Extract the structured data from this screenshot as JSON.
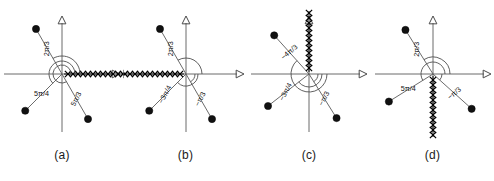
{
  "figure": {
    "panel_count": 4,
    "colors": {
      "axis": "#6b6b6b",
      "ray": "#5a5a5a",
      "pole": "#111111",
      "zero": "#000000",
      "arc": "#4f4f4f",
      "background": "#ffffff",
      "text": "#1a1a1a"
    },
    "marker_semantics": {
      "filled_dot": "pole",
      "x_mark": "zero"
    }
  },
  "panels": [
    {
      "id": "a",
      "caption": "(a)",
      "poles": [
        {
          "angle_label": "2π/3",
          "angle_deg": 120,
          "radius": 52,
          "label_rotation_deg": -90
        },
        {
          "angle_label": "5π/4",
          "angle_deg": 225,
          "radius": 52,
          "label_rotation_deg": 0
        },
        {
          "angle_label": "5π/3",
          "angle_deg": 300,
          "radius": 52,
          "label_rotation_deg": -62
        }
      ],
      "zero_chain": {
        "direction": "positive-real-axis",
        "direction_deg": 0,
        "count": 12,
        "has_arrowhead": true
      },
      "arcs": [
        {
          "for_angle_label": "2π/3",
          "radius": 18
        },
        {
          "for_angle_label": "5π/4",
          "radius": 13
        },
        {
          "for_angle_label": "5π/3",
          "radius": 9
        }
      ],
      "axes": {
        "real": "horizontal",
        "imaginary": "vertical"
      }
    },
    {
      "id": "b",
      "caption": "(b)",
      "poles": [
        {
          "angle_label": "2π/3",
          "angle_deg": 120,
          "radius": 52,
          "label_rotation_deg": -90
        },
        {
          "angle_label": "−3π/4",
          "angle_deg": 225,
          "radius": 52,
          "label_rotation_deg": -62
        },
        {
          "angle_label": "−π/3",
          "angle_deg": 300,
          "radius": 52,
          "label_rotation_deg": -62
        }
      ],
      "zero_chain": {
        "direction": "negative-real-axis",
        "direction_deg": 180,
        "count": 12,
        "has_arrowhead": false
      },
      "arcs": [
        {
          "for_angle_label": "2π/3",
          "radius": 16
        },
        {
          "for_angle_label": "−3π/4",
          "radius": 12
        },
        {
          "for_angle_label": "−π/3",
          "radius": 9
        }
      ],
      "axes": {
        "real": "horizontal",
        "imaginary": "vertical"
      }
    },
    {
      "id": "c",
      "caption": "(c)",
      "poles": [
        {
          "angle_label": "−4π/3",
          "angle_deg": 132,
          "radius": 52,
          "label_rotation_deg": -40
        },
        {
          "angle_label": "−3π/4",
          "angle_deg": 218,
          "radius": 52,
          "label_rotation_deg": -62
        },
        {
          "angle_label": "−π/3",
          "angle_deg": 302,
          "radius": 52,
          "label_rotation_deg": -62
        }
      ],
      "zero_chain": {
        "direction": "positive-imaginary-axis",
        "direction_deg": 90,
        "count": 12,
        "has_arrowhead": false
      },
      "arcs": [
        {
          "for_angle_label": "−4π/3",
          "radius": 18
        },
        {
          "for_angle_label": "−3π/4",
          "radius": 13
        },
        {
          "for_angle_label": "−π/3",
          "radius": 9
        }
      ],
      "axes": {
        "real": "horizontal",
        "imaginary": "vertical"
      }
    },
    {
      "id": "d",
      "caption": "(d)",
      "poles": [
        {
          "angle_label": "2π/3",
          "angle_deg": 122,
          "radius": 52,
          "label_rotation_deg": -90
        },
        {
          "angle_label": "5π/4",
          "angle_deg": 212,
          "radius": 52,
          "label_rotation_deg": 0
        },
        {
          "angle_label": "−π/3",
          "angle_deg": 318,
          "radius": 52,
          "label_rotation_deg": -40
        }
      ],
      "zero_chain": {
        "direction": "negative-imaginary-axis",
        "direction_deg": 270,
        "count": 12,
        "has_arrowhead": false
      },
      "arcs": [
        {
          "for_angle_label": "2π/3",
          "radius": 17
        },
        {
          "for_angle_label": "5π/4",
          "radius": 12
        },
        {
          "for_angle_label": "−π/3",
          "radius": 9
        }
      ],
      "axes": {
        "real": "horizontal",
        "imaginary": "vertical"
      }
    }
  ]
}
